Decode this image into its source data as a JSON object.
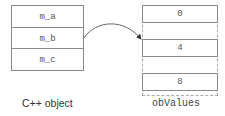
{
  "diagram": {
    "cpp_object": {
      "label": "C++ object",
      "fields": [
        "m_a",
        "m_b",
        "m_c"
      ]
    },
    "ob_values": {
      "label": "obValues",
      "slots": [
        "0",
        "4",
        "8"
      ]
    },
    "arrow": {
      "from": "m_b",
      "to": "4"
    },
    "colors": {
      "border": "#8a8a8a",
      "dashed": "#aaaaaa",
      "text": "#555555"
    }
  }
}
